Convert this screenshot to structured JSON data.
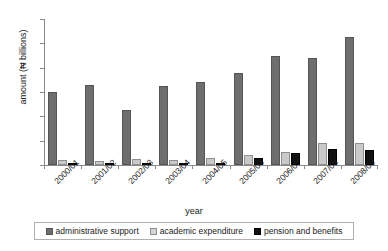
{
  "chart_data": {
    "type": "bar",
    "title": "",
    "xlabel": "year",
    "ylabel": "amount (₦ billions)",
    "ylim": [
      0,
      6
    ],
    "yticks": [
      0,
      1,
      2,
      3,
      4,
      5,
      6
    ],
    "grid": false,
    "legend_position": "bottom",
    "categories": [
      "2000/01",
      "2001/02",
      "2002/03",
      "2003/04",
      "2004/05",
      "2005/06",
      "2006/07",
      "2007/08",
      "2008/09"
    ],
    "series": [
      {
        "name": "administrative support",
        "color": "#6e6e6e",
        "values": [
          3.0,
          3.3,
          2.25,
          3.25,
          3.4,
          3.8,
          4.5,
          4.4,
          5.25
        ]
      },
      {
        "name": "academic expenditure",
        "color": "#c9c9c9",
        "values": [
          0.2,
          0.18,
          0.25,
          0.22,
          0.3,
          0.4,
          0.55,
          0.9,
          0.9
        ]
      },
      {
        "name": "pension and benefits",
        "color": "#111111",
        "values": [
          0.05,
          0.06,
          0.05,
          0.06,
          0.08,
          0.3,
          0.5,
          0.65,
          0.6
        ]
      }
    ]
  },
  "legend": {
    "items": [
      {
        "label": "administrative support"
      },
      {
        "label": "academic expenditure"
      },
      {
        "label": "pension and benefits"
      }
    ]
  }
}
